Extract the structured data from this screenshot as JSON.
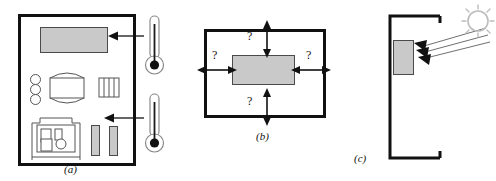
{
  "figure": {
    "type": "technical-diagram",
    "panel_count": 3
  },
  "colors": {
    "outline": "#111111",
    "fill_gray": "#c9c9c9",
    "fill_gray_stroke": "#4a4a4a",
    "thin_stroke": "#555555",
    "sun_stroke": "#bdbdbd",
    "background": "#ffffff"
  },
  "panels": [
    {
      "id": "a",
      "label": "(a)",
      "caption_position": "bottom-center",
      "enclosure": "closed rectangular room plan",
      "icons": [
        "display-rectangle-icon",
        "circle-icon",
        "circle-icon",
        "circle-icon",
        "table-icon",
        "hatched-panel-icon",
        "equipment-outline-icon",
        "gray-bar-icon",
        "gray-bar-icon"
      ],
      "thermometers": [
        {
          "name": "thermometer-upper",
          "points_to": "display-rectangle"
        },
        {
          "name": "thermometer-lower",
          "points_to": "gray-bar-group"
        }
      ],
      "arrow_count": 2,
      "arrow_direction": "right-to-left into room"
    },
    {
      "id": "b",
      "label": "(b)",
      "caption_position": "bottom-center",
      "enclosure": "closed rectangular boundary",
      "center_object": "gray-rectangle",
      "flows": [
        {
          "name": "flow-top",
          "direction": "vertical",
          "marker": "?"
        },
        {
          "name": "flow-left",
          "direction": "horizontal",
          "marker": "?"
        },
        {
          "name": "flow-right",
          "direction": "horizontal",
          "marker": "?"
        },
        {
          "name": "flow-bottom",
          "direction": "vertical",
          "marker": "?"
        }
      ],
      "marker_text": "?",
      "arrow_style": "double-headed crossing the boundary"
    },
    {
      "id": "c",
      "label": "(c)",
      "caption_position": "bottom-left",
      "enclosure": "C-shaped bracket, open on the right",
      "center_object": "gray-rectangle",
      "source": "sun-icon",
      "rays": 3,
      "ray_direction": "from sun down-left toward gray rectangle"
    }
  ]
}
